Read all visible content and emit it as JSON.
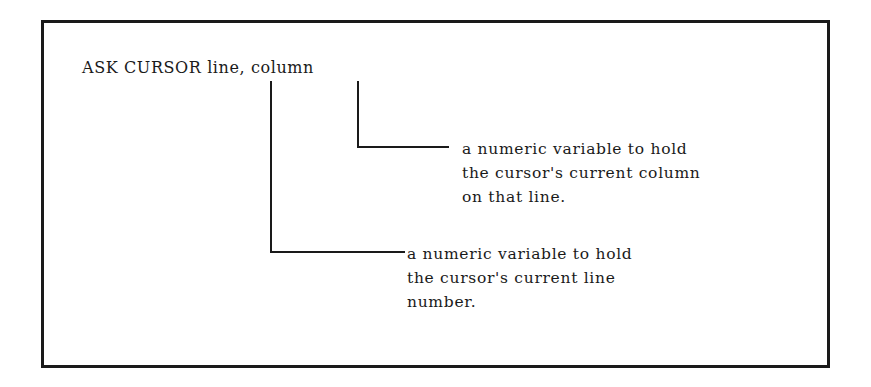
{
  "diagram": {
    "syntax": {
      "text": "ASK CURSOR line, column"
    },
    "annotations": {
      "column": {
        "target": "column",
        "lines": [
          "a numeric variable to hold",
          "the cursor's current column",
          "on that line."
        ]
      },
      "line": {
        "target": "line",
        "lines": [
          "a numeric variable to hold",
          "the cursor's current line",
          "number."
        ]
      }
    },
    "colors": {
      "ink": "#1a1a1a",
      "background": "#ffffff"
    }
  }
}
